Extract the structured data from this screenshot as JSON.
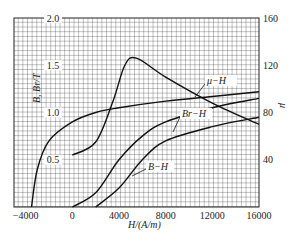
{
  "chart_data": {
    "type": "line",
    "title": "",
    "xlabel": "H/(A/m)",
    "ylabel_left": "B, Br/ T",
    "ylabel_right": "μ",
    "xlim": [
      -5000,
      16000
    ],
    "ylim_left": [
      0,
      2.0
    ],
    "ylim_right": [
      0,
      160
    ],
    "x_ticks": [
      "-4000",
      "0",
      "4000",
      "8000",
      "12000",
      "16000"
    ],
    "y_left_ticks": [
      "0.5",
      "1.0",
      "1.5",
      "2.0"
    ],
    "y_right_ticks": [
      "40",
      "80",
      "120",
      "160"
    ],
    "grid": true,
    "series": [
      {
        "name": "demagnetization",
        "axis": "left",
        "x": [
          -3500,
          -3000,
          -2000,
          0,
          2000,
          4000,
          8000,
          12000,
          16000
        ],
        "values": [
          0,
          0.4,
          0.7,
          0.9,
          1.0,
          1.05,
          1.12,
          1.17,
          1.22
        ]
      },
      {
        "name": "μ-H",
        "axis": "right",
        "x": [
          0,
          2000,
          3500,
          4500,
          5500,
          8000,
          12000,
          16000
        ],
        "values": [
          44,
          55,
          90,
          120,
          126,
          110,
          88,
          70
        ]
      },
      {
        "name": "Br-H",
        "axis": "left",
        "x": [
          0,
          2000,
          4000,
          6000,
          8000,
          12000,
          16000
        ],
        "values": [
          0,
          0.15,
          0.5,
          0.75,
          0.9,
          1.05,
          1.15
        ]
      },
      {
        "name": "B-H",
        "axis": "left",
        "x": [
          2000,
          4000,
          6000,
          8000,
          12000,
          16000
        ],
        "values": [
          0,
          0.2,
          0.5,
          0.7,
          0.85,
          0.95
        ]
      }
    ],
    "annotations": [
      "μ−H",
      "Br−H",
      "B−H"
    ]
  },
  "labels": {
    "x_axis": "H/(A/m)",
    "y_left": "B, Br/T",
    "y_right": "μ",
    "mu_h": "μ−H",
    "br_h": "Br−H",
    "b_h": "B−H"
  }
}
